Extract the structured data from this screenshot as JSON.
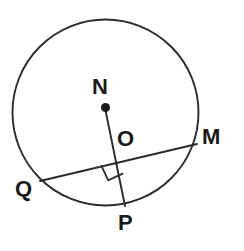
{
  "figure": {
    "background_color": "#ffffff",
    "stroke_color": "#2b2b2b",
    "label_color": "#1a1a1a"
  },
  "labels": {
    "center": "N",
    "intersection": "O",
    "chord_right_endpoint": "M",
    "chord_left_endpoint": "Q",
    "radius_endpoint": "P"
  },
  "chart_data": {
    "type": "diagram",
    "shape": "circle",
    "circle": {
      "center_label": "N",
      "center": [
        105,
        112
      ],
      "radius": 93,
      "stroke_width": 1.8
    },
    "points": [
      {
        "label": "N",
        "x": 105,
        "y": 108,
        "role": "center",
        "marker": "filled-dot",
        "marker_radius": 4.5
      },
      {
        "label": "O",
        "x": 116,
        "y": 158,
        "role": "intersection",
        "marker": "none"
      },
      {
        "label": "M",
        "x": 196,
        "y": 145,
        "role": "chord-endpoint-on-circle",
        "marker": "none"
      },
      {
        "label": "Q",
        "x": 40,
        "y": 181,
        "role": "chord-endpoint-on-circle",
        "marker": "none"
      },
      {
        "label": "P",
        "x": 125,
        "y": 204,
        "role": "radius-endpoint-on-circle",
        "marker": "none"
      }
    ],
    "segments": [
      {
        "name": "chord-QM",
        "from": "Q",
        "to": "M",
        "x1": 40,
        "y1": 181,
        "x2": 197,
        "y2": 144,
        "stroke_width": 1.8
      },
      {
        "name": "radius-NP",
        "from": "N",
        "to": "P",
        "x1": 105,
        "y1": 108,
        "x2": 125,
        "y2": 206,
        "stroke_width": 1.8
      }
    ],
    "angle_markers": [
      {
        "name": "right-angle-at-O",
        "at": "O",
        "type": "square",
        "size": 15,
        "degrees": 90
      }
    ],
    "axis_ranges": {
      "xlim": [
        0,
        244
      ],
      "ylim": [
        0,
        251
      ]
    },
    "grid": false,
    "legend": null
  }
}
